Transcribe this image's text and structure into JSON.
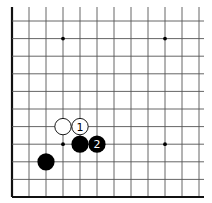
{
  "diagram": {
    "type": "go-board-fragment",
    "columns": 12,
    "rows": 11,
    "edges": {
      "left": true,
      "bottom": true,
      "top": false,
      "right": false
    },
    "grid": {
      "x0": 12,
      "y0": 21,
      "dx": 17,
      "dy": 17.6,
      "line_color": "#555555",
      "edge_color": "#111111"
    },
    "star_points": [
      {
        "col": 3,
        "row": 1
      },
      {
        "col": 9,
        "row": 1
      },
      {
        "col": 3,
        "row": 7
      },
      {
        "col": 9,
        "row": 7
      }
    ],
    "stones": [
      {
        "color": "white",
        "col": 3,
        "row": 6,
        "label": ""
      },
      {
        "color": "white",
        "col": 4,
        "row": 6,
        "label": "1"
      },
      {
        "color": "black",
        "col": 4,
        "row": 7,
        "label": ""
      },
      {
        "color": "black",
        "col": 5,
        "row": 7,
        "label": "2"
      },
      {
        "color": "black",
        "col": 2,
        "row": 8,
        "label": ""
      }
    ]
  }
}
